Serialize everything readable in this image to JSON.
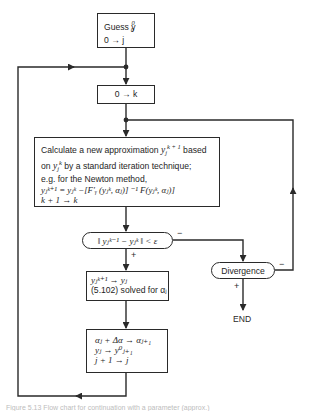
{
  "diagram": {
    "type": "flowchart",
    "colors": {
      "line": "#2a2a2a",
      "background": "#ffffff",
      "text": "#1e1e1e"
    },
    "nodes": {
      "init": {
        "line1": "Guess y",
        "line1_sup": "0",
        "line1_sub": "0",
        "line2": "0 → j"
      },
      "reset_k": {
        "text": "0 → k"
      },
      "iterate": {
        "line1_a": "Calculate a new approximation ",
        "line1_var": "y",
        "line1_sub": "j",
        "line1_sup": "k + 1",
        "line1_b": " based",
        "line2_a": "on ",
        "line2_var": "y",
        "line2_sub": "j",
        "line2_sup": "k",
        "line2_b": " by a standard iteration technique;",
        "line3": "e.g.  for the Newton method,",
        "line4": "yⱼᵏ⁺¹ = yⱼᵏ −[F′ᵧ (yⱼᵏ, αⱼ)] ⁻¹ F(yⱼᵏ, αⱼ)]",
        "line5": "k + 1 → k"
      },
      "convergence_test": {
        "text": "‖ yⱼᵏ⁻¹ − yⱼᵏ ‖ < ε"
      },
      "accept": {
        "line1": "yⱼᵏ⁺¹ → yⱼ",
        "line2": "(5.102) solved for αⱼ"
      },
      "advance": {
        "line1": "αⱼ + Δα → αⱼ₊₁",
        "line2": "yⱼ → y⁰ⱼ₊₁",
        "line3": "j + 1 → j"
      },
      "divergence": {
        "text": "Divergence"
      },
      "end": {
        "text": "END"
      }
    },
    "edge_labels": {
      "test_plus": "+",
      "test_minus": "−",
      "divergence_plus": "+",
      "divergence_minus": "−"
    },
    "caption": "Figure 5.13  Flow chart for continuation with a parameter (approx.)"
  }
}
